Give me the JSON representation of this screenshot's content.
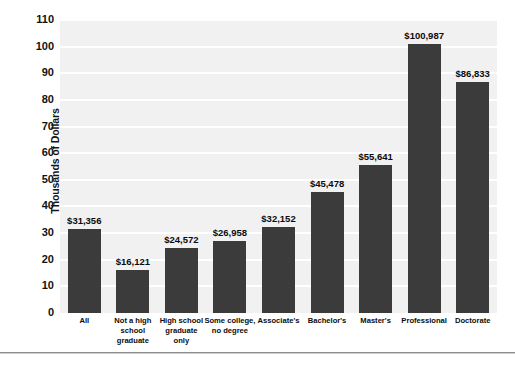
{
  "chart_data": {
    "type": "bar",
    "title": "",
    "xlabel": "",
    "ylabel": "Thousands of Dollars",
    "ylim": [
      0,
      110
    ],
    "ytick_step": 10,
    "yticks": [
      110,
      100,
      90,
      80,
      70,
      60,
      50,
      40,
      30,
      20,
      10,
      0
    ],
    "grid": true,
    "legend": "none",
    "value_unit": "dollars",
    "categories": [
      "All",
      "Not a high school graduate",
      "High school graduate only",
      "Some college, no degree",
      "Associate's",
      "Bachelor's",
      "Master's",
      "Professional",
      "Doctorate"
    ],
    "category_label_lines": [
      [
        "All"
      ],
      [
        "Not a high",
        "school",
        "graduate"
      ],
      [
        "High school",
        "graduate",
        "only"
      ],
      [
        "Some college,",
        "no degree"
      ],
      [
        "Associate's"
      ],
      [
        "Bachelor's"
      ],
      [
        "Master's"
      ],
      [
        "Professional"
      ],
      [
        "Doctorate"
      ]
    ],
    "values": [
      31356,
      16121,
      24572,
      26958,
      32152,
      45478,
      55641,
      100987,
      86833
    ],
    "value_labels": [
      "$31,356",
      "$16,121",
      "$24,572",
      "$26,958",
      "$32,152",
      "$45,478",
      "$55,641",
      "$100,987",
      "$86,833"
    ],
    "colors": {
      "bar": "#3b3b3b",
      "plot_background": "#f1f1f1",
      "gridline": "#ffffff",
      "text": "#0c0c0c",
      "rule": "#8d8d8d"
    }
  }
}
